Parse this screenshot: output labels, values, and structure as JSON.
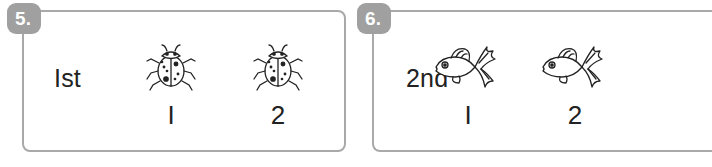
{
  "exercises": [
    {
      "number": "5.",
      "ordinal": "Ist",
      "items": [
        {
          "icon": "ladybug-icon",
          "label": "I"
        },
        {
          "icon": "ladybug-icon",
          "label": "2"
        }
      ]
    },
    {
      "number": "6.",
      "ordinal": "2nd",
      "items": [
        {
          "icon": "goldfish-icon",
          "label": "I"
        },
        {
          "icon": "goldfish-icon",
          "label": "2"
        }
      ]
    }
  ],
  "colors": {
    "border": "#a9a9a9",
    "badge": "#a0a0a0",
    "text": "#222222"
  }
}
